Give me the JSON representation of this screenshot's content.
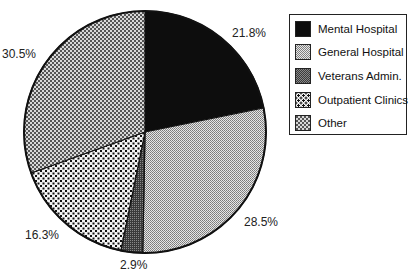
{
  "chart_data": {
    "type": "pie",
    "title": "",
    "categories": [
      "Mental Hospital",
      "General Hospital",
      "Veterans Admin.",
      "Outpatient Clinics",
      "Other"
    ],
    "values": [
      21.8,
      28.5,
      2.9,
      16.3,
      30.5
    ],
    "labels": [
      "21.8%",
      "28.5%",
      "2.9%",
      "16.3%",
      "30.5%"
    ],
    "start_angle": "12 o'clock",
    "direction": "clockwise",
    "legend_position": "right",
    "fills": [
      "solid-black",
      "light-gray-checker",
      "dark-gray-checker",
      "dots",
      "crosshatch"
    ]
  },
  "legend": {
    "items": [
      {
        "label": "Mental Hospital"
      },
      {
        "label": "General Hospital"
      },
      {
        "label": "Veterans Admin."
      },
      {
        "label": "Outpatient Clinics"
      },
      {
        "label": "Other"
      }
    ]
  }
}
